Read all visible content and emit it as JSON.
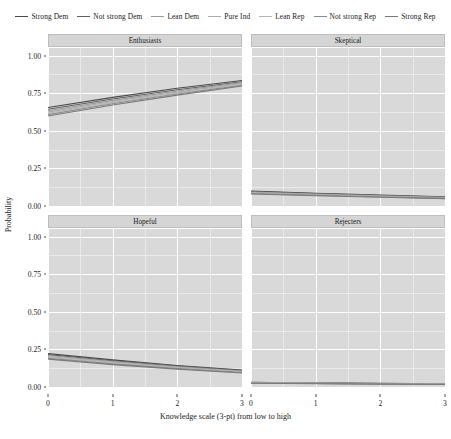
{
  "chart_data": {
    "type": "line",
    "title": "",
    "subtitle": "",
    "xlabel": "Knowledge scale (3-pt) from low to high",
    "ylabel": "Probability",
    "xlim": [
      0,
      3
    ],
    "ylim": [
      0,
      1.05
    ],
    "xticks": [
      "0",
      "1",
      "2",
      "3"
    ],
    "xtick_values": [
      0,
      1,
      2,
      3
    ],
    "yticks": [
      "0.00",
      "0.25",
      "0.50",
      "0.75",
      "1.00"
    ],
    "ytick_values": [
      0.0,
      0.25,
      0.5,
      0.75,
      1.0
    ],
    "grid": true,
    "grid_color": "#ffffff",
    "panel_background": "#d9d9d9",
    "strip_background": "#d5d5d5",
    "legend_position": "top",
    "facet_layout": "2x2",
    "legend": [
      {
        "name": "Strong Dem",
        "color": "#4a4a4a"
      },
      {
        "name": "Not strong Dem",
        "color": "#5f5f5f"
      },
      {
        "name": "Lean Dem",
        "color": "#9a9a9a"
      },
      {
        "name": "Pure Ind",
        "color": "#ababab"
      },
      {
        "name": "Lean Rep",
        "color": "#b5b5b5"
      },
      {
        "name": "Not strong Rep",
        "color": "#8c8c8c"
      },
      {
        "name": "Strong Rep",
        "color": "#7a7a7a"
      }
    ],
    "x": [
      0,
      1,
      2,
      3
    ],
    "panels": [
      {
        "title": "Enthusiasts",
        "row": 0,
        "col": 0,
        "series": [
          {
            "name": "Strong Dem",
            "values": [
              0.655,
              0.722,
              0.782,
              0.834
            ]
          },
          {
            "name": "Not strong Dem",
            "values": [
              0.643,
              0.711,
              0.772,
              0.826
            ]
          },
          {
            "name": "Lean Dem",
            "values": [
              0.633,
              0.702,
              0.764,
              0.82
            ]
          },
          {
            "name": "Pure Ind",
            "values": [
              0.624,
              0.694,
              0.757,
              0.814
            ]
          },
          {
            "name": "Lean Rep",
            "values": [
              0.616,
              0.687,
              0.751,
              0.809
            ]
          },
          {
            "name": "Not strong Rep",
            "values": [
              0.607,
              0.679,
              0.744,
              0.803
            ]
          },
          {
            "name": "Strong Rep",
            "values": [
              0.598,
              0.671,
              0.737,
              0.798
            ]
          }
        ]
      },
      {
        "title": "Skeptical",
        "row": 0,
        "col": 1,
        "series": [
          {
            "name": "Strong Dem",
            "values": [
              0.1,
              0.085,
              0.072,
              0.061
            ]
          },
          {
            "name": "Not strong Dem",
            "values": [
              0.096,
              0.082,
              0.07,
              0.059
            ]
          },
          {
            "name": "Lean Dem",
            "values": [
              0.093,
              0.079,
              0.067,
              0.057
            ]
          },
          {
            "name": "Pure Ind",
            "values": [
              0.089,
              0.076,
              0.065,
              0.055
            ]
          },
          {
            "name": "Lean Rep",
            "values": [
              0.086,
              0.073,
              0.063,
              0.053
            ]
          },
          {
            "name": "Not strong Rep",
            "values": [
              0.083,
              0.071,
              0.06,
              0.051
            ]
          },
          {
            "name": "Strong Rep",
            "values": [
              0.08,
              0.068,
              0.058,
              0.049
            ]
          }
        ]
      },
      {
        "title": "Hopeful",
        "row": 1,
        "col": 0,
        "series": [
          {
            "name": "Strong Dem",
            "values": [
              0.222,
              0.18,
              0.143,
              0.113
            ]
          },
          {
            "name": "Not strong Dem",
            "values": [
              0.215,
              0.174,
              0.139,
              0.109
            ]
          },
          {
            "name": "Lean Dem",
            "values": [
              0.209,
              0.169,
              0.135,
              0.106
            ]
          },
          {
            "name": "Pure Ind",
            "values": [
              0.203,
              0.164,
              0.131,
              0.103
            ]
          },
          {
            "name": "Lean Rep",
            "values": [
              0.197,
              0.159,
              0.127,
              0.1
            ]
          },
          {
            "name": "Not strong Rep",
            "values": [
              0.191,
              0.154,
              0.123,
              0.096
            ]
          },
          {
            "name": "Strong Rep",
            "values": [
              0.185,
              0.149,
              0.119,
              0.093
            ]
          }
        ]
      },
      {
        "title": "Rejecters",
        "row": 1,
        "col": 1,
        "series": [
          {
            "name": "Strong Dem",
            "values": [
              0.031,
              0.027,
              0.024,
              0.021
            ]
          },
          {
            "name": "Not strong Dem",
            "values": [
              0.03,
              0.026,
              0.023,
              0.02
            ]
          },
          {
            "name": "Lean Dem",
            "values": [
              0.029,
              0.025,
              0.022,
              0.019
            ]
          },
          {
            "name": "Pure Ind",
            "values": [
              0.028,
              0.024,
              0.021,
              0.019
            ]
          },
          {
            "name": "Lean Rep",
            "values": [
              0.027,
              0.024,
              0.021,
              0.018
            ]
          },
          {
            "name": "Not strong Rep",
            "values": [
              0.026,
              0.023,
              0.02,
              0.018
            ]
          },
          {
            "name": "Strong Rep",
            "values": [
              0.025,
              0.022,
              0.019,
              0.017
            ]
          }
        ]
      }
    ]
  }
}
